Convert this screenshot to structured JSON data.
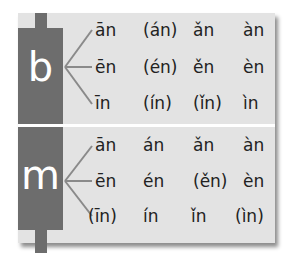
{
  "colors": {
    "panel": "#e3e3e3",
    "bar": "#6d6d6d",
    "divider": "#ffffff",
    "text": "#222222"
  },
  "groups": [
    {
      "initial": "b",
      "rows": [
        [
          "ān",
          "(án)",
          "ǎn",
          "àn"
        ],
        [
          "ēn",
          "(én)",
          "ěn",
          "èn"
        ],
        [
          "īn",
          "(ín)",
          "(ǐn)",
          "ìn"
        ]
      ]
    },
    {
      "initial": "m",
      "rows": [
        [
          "ān",
          "án",
          "ǎn",
          "àn"
        ],
        [
          "ēn",
          "én",
          "(ěn)",
          "èn"
        ],
        [
          "(īn)",
          "ín",
          "ǐn",
          "(ìn)"
        ]
      ]
    }
  ]
}
